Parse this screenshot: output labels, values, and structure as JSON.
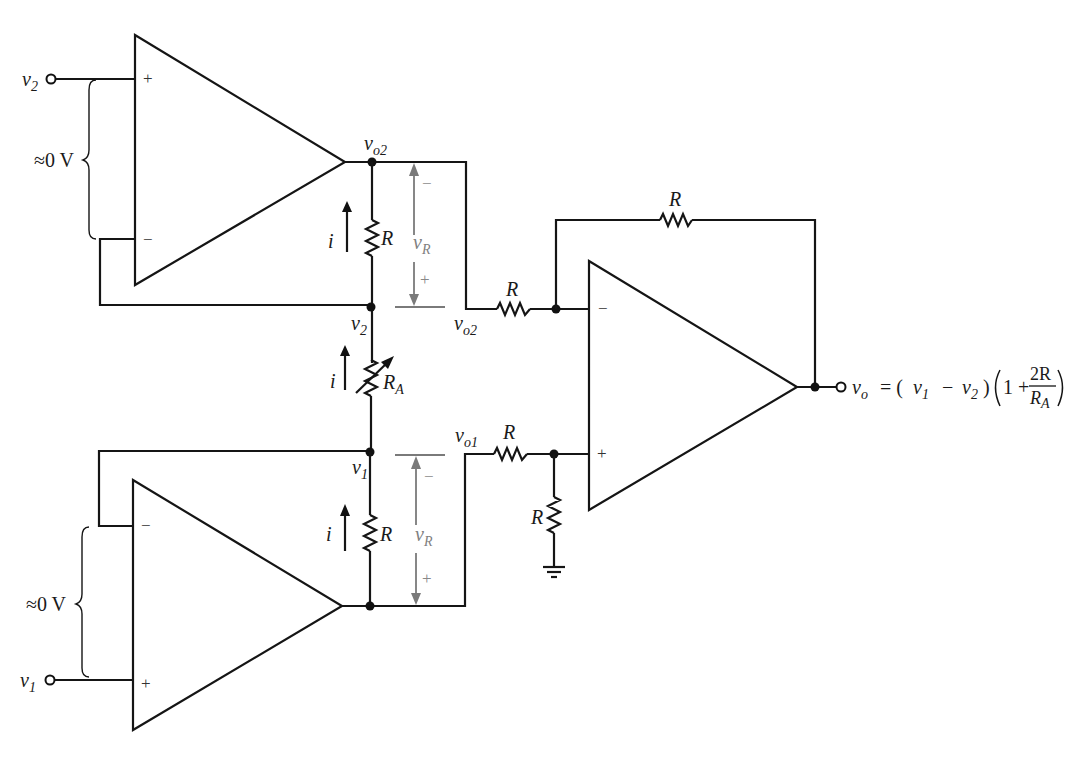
{
  "diagram": {
    "type": "instrumentation-amplifier-circuit",
    "inputs": {
      "v2": {
        "label": "v",
        "sub": "2"
      },
      "v1": {
        "label": "v",
        "sub": "1"
      }
    },
    "top_opamp": {
      "plus": "+",
      "minus": "−",
      "input_diff": "≈0 V"
    },
    "bottom_opamp": {
      "plus": "+",
      "minus": "−",
      "input_diff": "≈0 V"
    },
    "diff_opamp": {
      "plus": "+",
      "minus": "−"
    },
    "nodes": {
      "vo2_top": {
        "label": "v",
        "sub": "o2"
      },
      "vo2_mid": {
        "label": "v",
        "sub": "o2"
      },
      "vo1": {
        "label": "v",
        "sub": "o1"
      },
      "v2_node": {
        "label": "v",
        "sub": "2"
      },
      "v1_node": {
        "label": "v",
        "sub": "1"
      }
    },
    "resistors": {
      "r_top": "R",
      "r_gain": {
        "label": "R",
        "sub": "A"
      },
      "r_bottom": "R",
      "r_in_minus": "R",
      "r_in_plus": "R",
      "r_ground": "R",
      "r_feedback": "R"
    },
    "currents": {
      "top": "i",
      "middle": "i",
      "bottom": "i"
    },
    "voltage_drops": {
      "top": {
        "label": "v",
        "sub": "R",
        "minus": "−",
        "plus": "+"
      },
      "bottom": {
        "label": "v",
        "sub": "R",
        "minus": "−",
        "plus": "+"
      }
    },
    "output": {
      "lhs": "v",
      "lhs_sub": "o",
      "eq": "= (",
      "v1": "v",
      "v1_sub": "1",
      "minus": "−",
      "v2": "v",
      "v2_sub": "2",
      "close": ")",
      "one_plus": "1 +",
      "num": "2R",
      "den": "R",
      "den_sub": "A"
    },
    "colors": {
      "wire": "#151515",
      "annotation": "#7a7a7a",
      "background": "#ffffff"
    }
  }
}
